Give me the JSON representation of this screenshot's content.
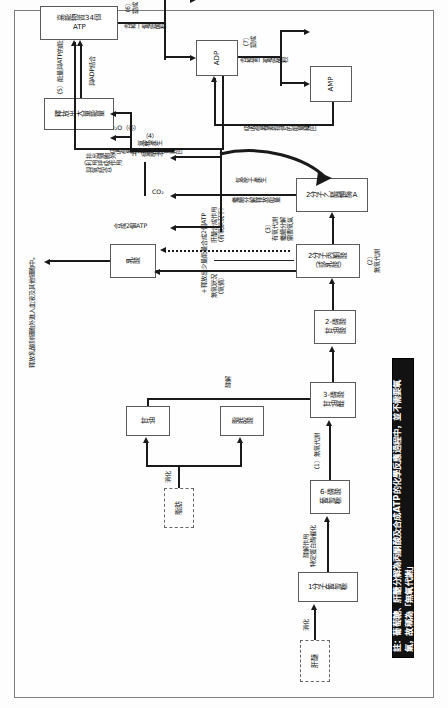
{
  "document": {
    "title": "醣類與脂肪代謝及ATP合成流程圖",
    "orientation": "rotated-90",
    "note": "註：葡萄糖、肝醣分解為丙酮酸及合成ATP的化學反應過程中，並不需要氧氣，故稱為「無氧代謝」"
  },
  "nodes": {
    "liver_glycogen": "肝醣",
    "glucose_1": "1分子葡萄糖",
    "g6p": "6-磷酸\n葡萄糖",
    "fat": "脂肪",
    "glycerol": "甘油",
    "fatty_acid": "脂肪酸",
    "g3p": "3-磷酸\n甘油醛",
    "pga2": "2-磷酸\n甘油酸",
    "pyruvate": "2分子丙酮酸\n（或乳酸）",
    "lactate": "乳酸",
    "acetyl": "2分子乙醯輔酶A",
    "water": "H₂O（水）",
    "big_energy": "釋放出大量能量",
    "atp34": "高能物質34個\nATP",
    "adp": "ADP",
    "amp": "AMP"
  },
  "edge_labels": {
    "fat_to_parts": "消化",
    "glucose_enzyme": "酵解作用\n特定蛋白酶催化",
    "step1": "（1）無氧代謝",
    "glycerol_to_g3p": "酵解",
    "anaerobic_2": "（2）\n無氧代謝",
    "atp2": "＋釋放出少量能量合成2個ATP",
    "lactate_back": "肝醣合成作用\n（有氧狀況下）",
    "lactate_out": "無氧狀況\n（氧債）",
    "lactate_blood": "釋放乳酸到細胞外進入血液及其他細胞中。",
    "aerobic_3": "（3）\n有氧代謝\n繼續分解\n需要氧氣",
    "acetyl_cont": "繼續分解釋放能量",
    "acetyl_h": "氫原子產生",
    "atp_made": "合成2個ATP",
    "co2": "CO₂",
    "co2_out": "排出細胞外\n（利用呼吸作用\n與氧結合）",
    "h_atom": "H（氫原子）",
    "step4": "（4）\n氧化產生",
    "step5": "（5）能量與ATP的能量",
    "step5b": "與ADP結合",
    "step6": "（6）\n變成",
    "step6b": "去掉一個磷酸根",
    "step7": "（7）\n變成",
    "step7b": "去掉第二個磷酸根",
    "release_energy": "釋放出能量供身體所需",
    "step8": "（8）\n吸收營養素提供的能量轉回",
    "amp_back": "吸收營養素提供的能量轉回"
  }
}
